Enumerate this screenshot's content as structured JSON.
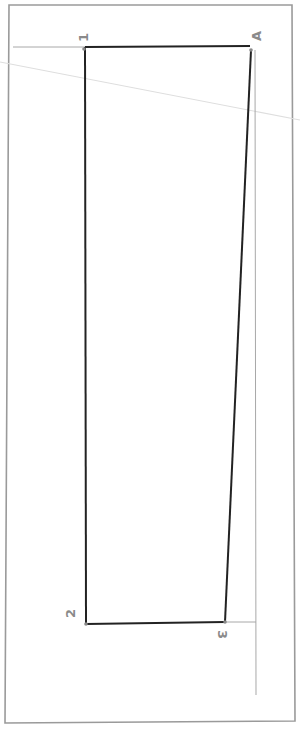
{
  "diagram": {
    "type": "pattern-draft",
    "colors": {
      "frame": "#9a9a9a",
      "outline": "#222222",
      "guide": "#a8a8a8",
      "faint_line": "#dcdcdc",
      "label": "#8a8a8a",
      "background": "#ffffff"
    },
    "points": [
      {
        "id": "1",
        "label": "1",
        "x": 85,
        "y": 47
      },
      {
        "id": "A",
        "label": "A",
        "x": 250,
        "y": 46
      },
      {
        "id": "3",
        "label": "3",
        "x": 225,
        "y": 622
      },
      {
        "id": "2",
        "label": "2",
        "x": 86,
        "y": 624
      }
    ],
    "labels": {
      "p1": "1",
      "pA": "A",
      "p2": "2",
      "p3": "3"
    }
  }
}
